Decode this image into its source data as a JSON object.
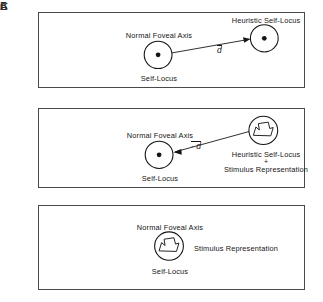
{
  "figure": {
    "stroke_color": "#4a4a4a",
    "ink_color": "#151515"
  },
  "panels": [
    {
      "id": "A",
      "label": "A",
      "annotations": {
        "normal_foveal_axis": "Normal Foveal Axis",
        "self_locus": "Self-Locus",
        "heuristic_self_locus": "Heuristic Self-Locus",
        "vector_label": "d"
      },
      "shapes": {
        "left_circle": "self-locus circle with center dot",
        "right_circle": "heuristic self-locus circle with center dot",
        "arrow_direction": "left-to-right"
      }
    },
    {
      "id": "B",
      "label": "B",
      "annotations": {
        "normal_foveal_axis": "Normal Foveal Axis",
        "self_locus": "Self-Locus",
        "heuristic_self_locus": "Heuristic Self-Locus",
        "conjunction": "+",
        "stimulus_representation": "Stimulus Representation",
        "vector_label": "- d"
      },
      "shapes": {
        "left_circle": "self-locus circle with center dot",
        "right_circle": "heuristic self-locus circle containing stimulus blob",
        "arrow_direction": "right-to-left"
      }
    },
    {
      "id": "C",
      "label": "C",
      "annotations": {
        "normal_foveal_axis": "Normal Foveal Axis",
        "self_locus": "Self-Locus",
        "stimulus_representation": "Stimulus Representation"
      },
      "shapes": {
        "center_circle": "self-locus circle containing stimulus blob",
        "arrow_direction": "none"
      }
    }
  ]
}
